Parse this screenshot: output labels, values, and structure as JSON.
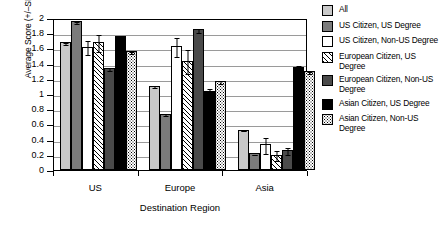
{
  "chart_data": {
    "type": "bar",
    "title": "",
    "xlabel": "Destination Region",
    "ylabel": "Average Score (+/–SEM)",
    "categories": [
      "US",
      "Europe",
      "Asia"
    ],
    "ylim": [
      0,
      2
    ],
    "ytick_labels": [
      "2",
      "1.8",
      "1.6",
      "1.4",
      "1.2",
      "1",
      "0.8",
      "0.6",
      "0.4",
      "0.2",
      "0"
    ],
    "ytick_values": [
      2,
      1.8,
      1.6,
      1.4,
      1.2,
      1,
      0.8,
      0.6,
      0.4,
      0.2,
      0
    ],
    "grid": true,
    "legend_position": "right",
    "series": [
      {
        "name": "All",
        "swatch": "light-gray",
        "color": "#c9c9c9",
        "values": [
          1.68,
          1.11,
          0.53
        ],
        "errors": [
          0.02,
          0.02,
          0.01
        ]
      },
      {
        "name": "US Citizen, US Degree",
        "swatch": "medium-gray",
        "color": "#7b7b7b",
        "values": [
          1.96,
          0.74,
          0.22
        ],
        "errors": [
          0.02,
          0.02,
          0.01
        ]
      },
      {
        "name": "US Citizen, Non-US Degree",
        "swatch": "white",
        "color": "#ffffff",
        "values": [
          1.62,
          1.63,
          0.34
        ],
        "errors": [
          0.1,
          0.13,
          0.11
        ]
      },
      {
        "name": "European Citizen, US Degree",
        "swatch": "diagonal-hatch",
        "color": "#ffffff",
        "values": [
          1.68,
          1.44,
          0.2
        ],
        "errors": [
          0.12,
          0.16,
          0.07
        ]
      },
      {
        "name": "European Citizen, Non-US Degree",
        "swatch": "dark-gray",
        "color": "#4a4a4a",
        "values": [
          1.34,
          1.85,
          0.26
        ],
        "errors": [
          0.03,
          0.03,
          0.05
        ]
      },
      {
        "name": "Asian Citizen, US Degree",
        "swatch": "black",
        "color": "#000000",
        "values": [
          1.76,
          1.04,
          1.35
        ],
        "errors": [
          0.03,
          0.05,
          0.04
        ]
      },
      {
        "name": "Asian Citizen, Non-US Degree",
        "swatch": "dotted",
        "color": "#ffffff",
        "values": [
          1.56,
          1.17,
          1.3
        ],
        "errors": [
          0.02,
          0.03,
          0.02
        ]
      }
    ]
  }
}
